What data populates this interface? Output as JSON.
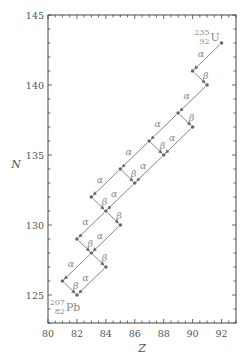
{
  "chart_data": {
    "type": "scatter",
    "title": "",
    "xlabel": "Z",
    "ylabel": "N",
    "xlim": [
      80,
      93
    ],
    "ylim": [
      123,
      145
    ],
    "x_ticks": [
      80,
      82,
      84,
      86,
      88,
      90,
      92
    ],
    "y_ticks": [
      125,
      130,
      135,
      140,
      145
    ],
    "grid": false,
    "legend": null,
    "nuclides": [
      {
        "Z": 92,
        "N": 143
      },
      {
        "Z": 90,
        "N": 141
      },
      {
        "Z": 91,
        "N": 140
      },
      {
        "Z": 89,
        "N": 138
      },
      {
        "Z": 90,
        "N": 137
      },
      {
        "Z": 87,
        "N": 136
      },
      {
        "Z": 88,
        "N": 135
      },
      {
        "Z": 85,
        "N": 134
      },
      {
        "Z": 86,
        "N": 133
      },
      {
        "Z": 83,
        "N": 132
      },
      {
        "Z": 84,
        "N": 131
      },
      {
        "Z": 85,
        "N": 130
      },
      {
        "Z": 82,
        "N": 129
      },
      {
        "Z": 83,
        "N": 128
      },
      {
        "Z": 84,
        "N": 127
      },
      {
        "Z": 81,
        "N": 126
      },
      {
        "Z": 82,
        "N": 125
      }
    ],
    "decays": [
      {
        "from": [
          92,
          143
        ],
        "to": [
          90,
          141
        ],
        "type": "α"
      },
      {
        "from": [
          90,
          141
        ],
        "to": [
          91,
          140
        ],
        "type": "β"
      },
      {
        "from": [
          91,
          140
        ],
        "to": [
          89,
          138
        ],
        "type": "α"
      },
      {
        "from": [
          89,
          138
        ],
        "to": [
          90,
          137
        ],
        "type": "β"
      },
      {
        "from": [
          89,
          138
        ],
        "to": [
          87,
          136
        ],
        "type": "α"
      },
      {
        "from": [
          90,
          137
        ],
        "to": [
          88,
          135
        ],
        "type": "α"
      },
      {
        "from": [
          87,
          136
        ],
        "to": [
          88,
          135
        ],
        "type": "β"
      },
      {
        "from": [
          87,
          136
        ],
        "to": [
          85,
          134
        ],
        "type": "α"
      },
      {
        "from": [
          88,
          135
        ],
        "to": [
          86,
          133
        ],
        "type": "α"
      },
      {
        "from": [
          85,
          134
        ],
        "to": [
          86,
          133
        ],
        "type": "β"
      },
      {
        "from": [
          85,
          134
        ],
        "to": [
          83,
          132
        ],
        "type": "α"
      },
      {
        "from": [
          86,
          133
        ],
        "to": [
          84,
          131
        ],
        "type": "α"
      },
      {
        "from": [
          83,
          132
        ],
        "to": [
          84,
          131
        ],
        "type": "β"
      },
      {
        "from": [
          84,
          131
        ],
        "to": [
          82,
          129
        ],
        "type": "α"
      },
      {
        "from": [
          84,
          131
        ],
        "to": [
          85,
          130
        ],
        "type": "β"
      },
      {
        "from": [
          85,
          130
        ],
        "to": [
          83,
          128
        ],
        "type": "α"
      },
      {
        "from": [
          82,
          129
        ],
        "to": [
          83,
          128
        ],
        "type": "β"
      },
      {
        "from": [
          83,
          128
        ],
        "to": [
          81,
          126
        ],
        "type": "α"
      },
      {
        "from": [
          83,
          128
        ],
        "to": [
          84,
          127
        ],
        "type": "β"
      },
      {
        "from": [
          81,
          126
        ],
        "to": [
          82,
          125
        ],
        "type": "β"
      },
      {
        "from": [
          84,
          127
        ],
        "to": [
          82,
          125
        ],
        "type": "α"
      }
    ],
    "annotations": [
      {
        "symbol": "U",
        "mass": "235",
        "atomic": "92",
        "at": [
          92,
          143
        ],
        "position": "upper"
      },
      {
        "symbol": "Pb",
        "mass": "207",
        "atomic": "82",
        "at": [
          82,
          125
        ],
        "position": "lower"
      }
    ],
    "colors": {
      "axis": "#444444",
      "arrow": "#666666",
      "point": "#666666",
      "text": "#8a8a8a"
    }
  }
}
